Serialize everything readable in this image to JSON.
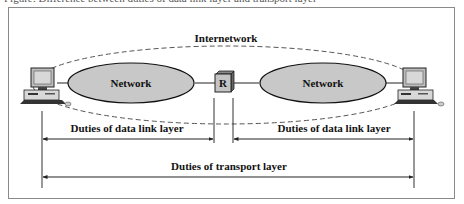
{
  "caption": "Figure: Difference between duties of data link layer and transport layer",
  "diagram": {
    "internetwork_label": "Internetwork",
    "networks": [
      {
        "label": "Network",
        "fill": "#c8c8c8"
      },
      {
        "label": "Network",
        "fill": "#c8c8c8"
      }
    ],
    "router": {
      "label": "R",
      "fill": "#c4c4c4"
    },
    "hosts": [
      {
        "name": "left-host"
      },
      {
        "name": "right-host"
      }
    ],
    "spans": [
      {
        "label": "Duties of data link layer",
        "from": "left-host",
        "to": "router"
      },
      {
        "label": "Duties of data link layer",
        "from": "router",
        "to": "right-host"
      },
      {
        "label": "Duties of transport layer",
        "from": "left-host",
        "to": "right-host"
      }
    ],
    "colors": {
      "frame": "#8a8a8a",
      "network_fill": "#c8c8c8",
      "line": "#222222",
      "dashed": "#555555"
    }
  }
}
